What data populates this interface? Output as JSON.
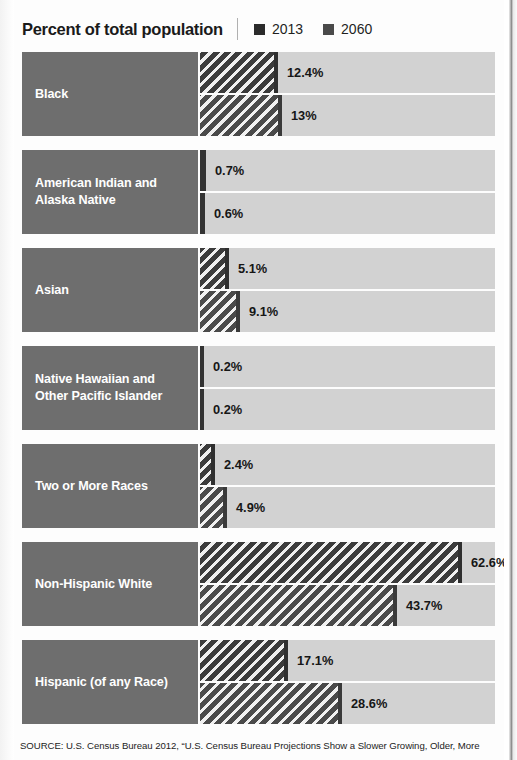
{
  "header": {
    "title": "Percent of total population",
    "legend": [
      {
        "label": "2013",
        "color": "#2b2b2b",
        "icon": "legend-swatch-icon"
      },
      {
        "label": "2060",
        "color": "#4a4a4a",
        "icon": "legend-swatch-icon"
      }
    ]
  },
  "source": {
    "text": "SOURCE: U.S. Census Bureau 2012, “U.S. Census Bureau Projections Show a Slower Growing, Older, More"
  },
  "colors": {
    "label_block": "#6e6e6e",
    "track": "#d2d2d2",
    "bar_2013": "#3b3b3b",
    "bar_2060": "#4a4a4a",
    "value_text": "#161616",
    "page_background": "#fdfdfd"
  },
  "chart_data": {
    "type": "bar",
    "title": "Percent of total population",
    "xlabel": "",
    "ylabel": "",
    "orientation": "horizontal",
    "grid": false,
    "legend_position": "top-right",
    "xlim": [
      0,
      70
    ],
    "unit": "%",
    "categories": [
      "Black",
      "American Indian and Alaska Native",
      "Asian",
      "Native Hawaiian and Other Pacific Islander",
      "Two or More Races",
      "Non-Hispanic White",
      "Hispanic (of any Race)"
    ],
    "series": [
      {
        "name": "2013",
        "values": [
          12.4,
          0.7,
          5.1,
          0.2,
          2.4,
          62.6,
          17.1
        ]
      },
      {
        "name": "2060",
        "values": [
          13.0,
          0.6,
          9.1,
          0.2,
          4.9,
          43.7,
          28.6
        ]
      }
    ]
  },
  "groups": [
    {
      "label": "Black",
      "label_line1": "Black",
      "label_line2": "",
      "rows": [
        {
          "series": "2013",
          "value": 12.4,
          "value_label": "12.4%",
          "bar_px": 78
        },
        {
          "series": "2060",
          "value": 13.0,
          "value_label": "13%",
          "bar_px": 82
        }
      ]
    },
    {
      "label": "American Indian and Alaska Native",
      "label_line1": "American Indian and",
      "label_line2": "Alaska Native",
      "rows": [
        {
          "series": "2013",
          "value": 0.7,
          "value_label": "0.7%",
          "bar_px": 6
        },
        {
          "series": "2060",
          "value": 0.6,
          "value_label": "0.6%",
          "bar_px": 5
        }
      ]
    },
    {
      "label": "Asian",
      "label_line1": "Asian",
      "label_line2": "",
      "rows": [
        {
          "series": "2013",
          "value": 5.1,
          "value_label": "5.1%",
          "bar_px": 29
        },
        {
          "series": "2060",
          "value": 9.1,
          "value_label": "9.1%",
          "bar_px": 40
        }
      ]
    },
    {
      "label": "Native Hawaiian and Other Pacific Islander",
      "label_line1": "Native Hawaiian and",
      "label_line2": "Other Pacific Islander",
      "rows": [
        {
          "series": "2013",
          "value": 0.2,
          "value_label": "0.2%",
          "bar_px": 4
        },
        {
          "series": "2060",
          "value": 0.2,
          "value_label": "0.2%",
          "bar_px": 4
        }
      ]
    },
    {
      "label": "Two or More Races",
      "label_line1": "Two or More Races",
      "label_line2": "",
      "rows": [
        {
          "series": "2013",
          "value": 2.4,
          "value_label": "2.4%",
          "bar_px": 15
        },
        {
          "series": "2060",
          "value": 4.9,
          "value_label": "4.9%",
          "bar_px": 27
        }
      ]
    },
    {
      "label": "Non-Hispanic White",
      "label_line1": "Non-Hispanic White",
      "label_line2": "",
      "rows": [
        {
          "series": "2013",
          "value": 62.6,
          "value_label": "62.6%",
          "bar_px": 262
        },
        {
          "series": "2060",
          "value": 43.7,
          "value_label": "43.7%",
          "bar_px": 197
        }
      ]
    },
    {
      "label": "Hispanic (of any Race)",
      "label_line1": "Hispanic (of any Race)",
      "label_line2": "",
      "rows": [
        {
          "series": "2013",
          "value": 17.1,
          "value_label": "17.1%",
          "bar_px": 88
        },
        {
          "series": "2060",
          "value": 28.6,
          "value_label": "28.6%",
          "bar_px": 142
        }
      ]
    }
  ]
}
